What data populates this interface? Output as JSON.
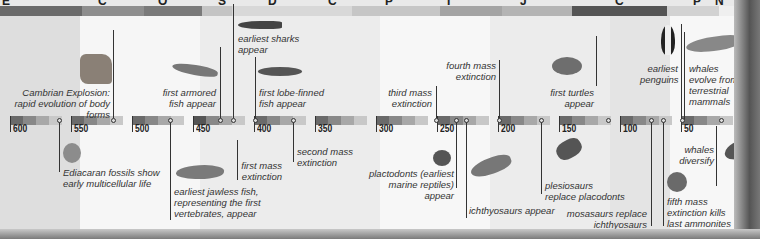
{
  "header": {
    "periods": [
      {
        "letter": "E",
        "sub": "6",
        "x": 2
      },
      {
        "letter": "C",
        "sub": "5",
        "x": 98
      },
      {
        "letter": "O",
        "sub": "4",
        "x": 158
      },
      {
        "letter": "S",
        "sub": "4",
        "x": 218
      },
      {
        "letter": "D",
        "sub": "4",
        "x": 268
      },
      {
        "letter": "C",
        "sub": "3",
        "x": 328
      },
      {
        "letter": "P",
        "sub": "2",
        "x": 385
      },
      {
        "letter": "T",
        "sub": "2",
        "x": 445
      },
      {
        "letter": "J",
        "sub": "1",
        "x": 520
      },
      {
        "letter": "C",
        "sub": "1",
        "x": 615
      },
      {
        "letter": "P",
        "sub": "",
        "x": 693
      },
      {
        "letter": "N",
        "sub": "",
        "x": 715
      },
      {
        "letter": "Q",
        "sub": "",
        "x": 740
      }
    ]
  },
  "axis": {
    "ticks": [
      {
        "label": "600",
        "x": 12
      },
      {
        "label": "550",
        "x": 72
      },
      {
        "label": "500",
        "x": 132
      },
      {
        "label": "450",
        "x": 193
      },
      {
        "label": "400",
        "x": 255
      },
      {
        "label": "350",
        "x": 316
      },
      {
        "label": "300",
        "x": 378
      },
      {
        "label": "250",
        "x": 438
      },
      {
        "label": "200",
        "x": 499
      },
      {
        "label": "150",
        "x": 560
      },
      {
        "label": "100",
        "x": 620
      },
      {
        "label": "50",
        "x": 681
      }
    ]
  },
  "events": [
    {
      "id": "cambrian",
      "text": "Cambrian Explosion: rapid evolution of body forms"
    },
    {
      "id": "ediacaran",
      "text": "Ediacaran fossils show early multicellular life"
    },
    {
      "id": "armored",
      "text": "first armored fish appear"
    },
    {
      "id": "jawless",
      "text": "earliest jawless fish, representing the first vertebrates, appear"
    },
    {
      "id": "sharks",
      "text": "earliest sharks appear"
    },
    {
      "id": "first_extinction",
      "text": "first mass extinction"
    },
    {
      "id": "lobe",
      "text": "first lobe-finned fish appear"
    },
    {
      "id": "second_extinction",
      "text": "second mass extinction"
    },
    {
      "id": "third_extinction",
      "text": "third mass extinction"
    },
    {
      "id": "placodonts",
      "text": "plactodonts (earliest marine reptiles) appear"
    },
    {
      "id": "ichthyosaurs",
      "text": "ichthyosaurs appear"
    },
    {
      "id": "fourth_extinction",
      "text": "fourth mass extinction"
    },
    {
      "id": "turtles",
      "text": "first turtles appear"
    },
    {
      "id": "plesiosaurs",
      "text": "plesiosaurs replace placodonts"
    },
    {
      "id": "mosasaurs",
      "text": "mosasaurs replace ichthyosaurs"
    },
    {
      "id": "fifth_extinction",
      "text": "fifth mass extinction kills last ammonites"
    },
    {
      "id": "penguins",
      "text": "earliest penguins"
    },
    {
      "id": "whales_evolve",
      "text": "whales evolve from terrestrial mammals"
    },
    {
      "id": "whales_diversify",
      "text": "whales diversify"
    }
  ],
  "colors": {
    "background": "#e9e9e9",
    "white_band": "#f7f7f7",
    "text": "#333333",
    "dark_bar": "#555555"
  }
}
